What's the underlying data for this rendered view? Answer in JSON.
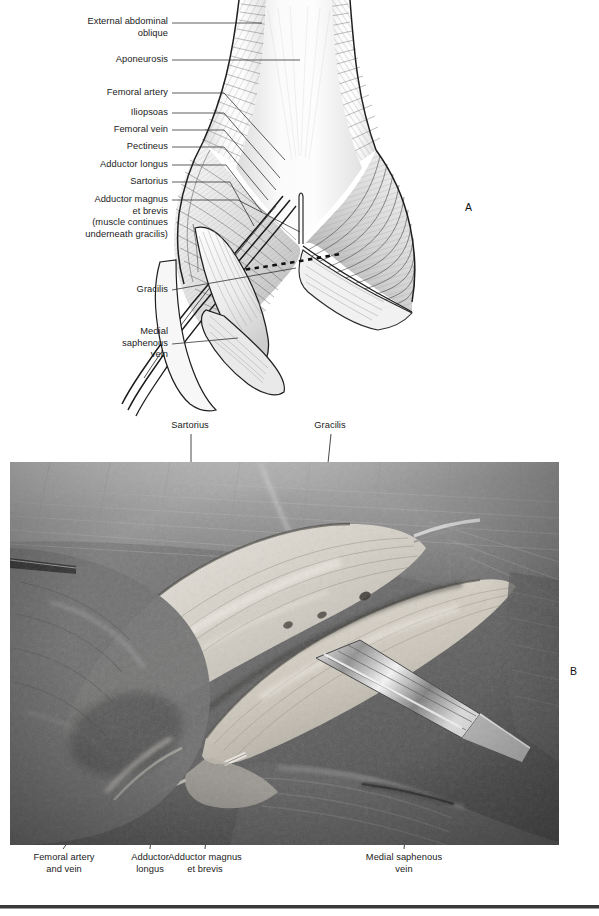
{
  "figure": {
    "panels": [
      {
        "letter": "A",
        "kind": "line-drawing"
      },
      {
        "letter": "B",
        "kind": "cadaver-photograph"
      }
    ]
  },
  "panel_a": {
    "letter": "A",
    "labels": [
      {
        "id": "external-abdominal-oblique",
        "text": "External abdominal\noblique"
      },
      {
        "id": "aponeurosis",
        "text": "Aponeurosis"
      },
      {
        "id": "femoral-artery",
        "text": "Femoral artery"
      },
      {
        "id": "iliopsoas",
        "text": "Iliopsoas"
      },
      {
        "id": "femoral-vein",
        "text": "Femoral vein"
      },
      {
        "id": "pectineus",
        "text": "Pectineus"
      },
      {
        "id": "adductor-longus",
        "text": "Adductor longus"
      },
      {
        "id": "sartorius",
        "text": "Sartorius"
      },
      {
        "id": "adductor-magnus-et-brevis",
        "text": "Adductor magnus\net brevis\n(muscle continues\nunderneath gracilis)"
      },
      {
        "id": "gracilis",
        "text": "Gracilis"
      },
      {
        "id": "medial-saphenous-vein",
        "text": "Medial\nsaphenous\nvein"
      }
    ]
  },
  "panel_b": {
    "letter": "B",
    "labels_above": [
      {
        "id": "sartorius",
        "text": "Sartorius"
      },
      {
        "id": "gracilis",
        "text": "Gracilis"
      }
    ],
    "labels_below": [
      {
        "id": "femoral-artery-and-vein",
        "text": "Femoral artery\nand vein"
      },
      {
        "id": "adductor-longus",
        "text": "Adductor\nlongus"
      },
      {
        "id": "adductor-magnus-et-brevis",
        "text": "Adductor magnus\net brevis"
      },
      {
        "id": "medial-saphenous-vein",
        "text": "Medial saphenous\nvein"
      }
    ]
  },
  "colors": {
    "text": "#1b1b1b",
    "leader": "#2a2a2a",
    "outline": "#1f1f1f",
    "muscle_light": "#f2f2f2",
    "muscle_mid": "#cfcfcf",
    "muscle_dark": "#8e8e8e",
    "photo_bg": "#6f6f6f",
    "rule": "#3a3a3a"
  }
}
